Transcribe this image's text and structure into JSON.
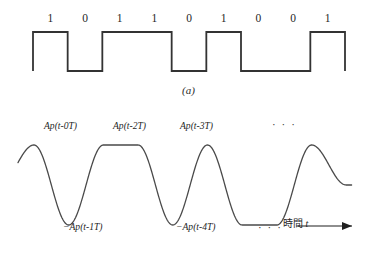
{
  "figure": {
    "panel_a": {
      "caption": "(a)",
      "bits": [
        "1",
        "0",
        "1",
        "1",
        "0",
        "1",
        "0",
        "0",
        "1"
      ],
      "waveform": {
        "type": "square",
        "description": "NRZ binary square wave",
        "levels_high_y": 32,
        "levels_low_y": 71,
        "x_start": 33,
        "x_end": 345,
        "bit_width": 34.7,
        "stroke": "#333333",
        "stroke_width": 1.8
      }
    },
    "panel_b": {
      "caption": "(b)",
      "waveform": {
        "type": "raised-cosine-pulse-train",
        "description": "Sum of A*p(t-nT) pulses, alternating polarity per bit",
        "baseline_y": 185,
        "amplitude": 40,
        "x_start": 18,
        "x_end": 352,
        "pulse_spacing": 34.7,
        "stroke": "#4a4a4a",
        "stroke_width": 1.3,
        "polarities": [
          1,
          -1,
          1,
          1,
          -1,
          1,
          -1,
          -1,
          1
        ]
      },
      "labels_top": [
        {
          "text": "Ap(t-0T)",
          "x": 44,
          "y": 120
        },
        {
          "text": "Ap(t-2T)",
          "x": 113,
          "y": 120
        },
        {
          "text": "Ap(t-3T)",
          "x": 180,
          "y": 120
        }
      ],
      "labels_bottom": [
        {
          "text": "−Ap(t-1T)",
          "x": 63,
          "y": 221
        },
        {
          "text": "−Ap(t-4T)",
          "x": 176,
          "y": 221
        }
      ],
      "dots_top": {
        "text": "· · ·",
        "x": 272,
        "y": 118
      },
      "dots_bottom": {
        "text": "· · ·",
        "x": 258,
        "y": 221
      },
      "axis_label_time": "時間",
      "axis_label_variable": "t"
    }
  },
  "colors": {
    "background": "#ffffff",
    "ink": "#1a1a1a",
    "square_wave": "#333333",
    "pulse_wave": "#4a4a4a"
  }
}
